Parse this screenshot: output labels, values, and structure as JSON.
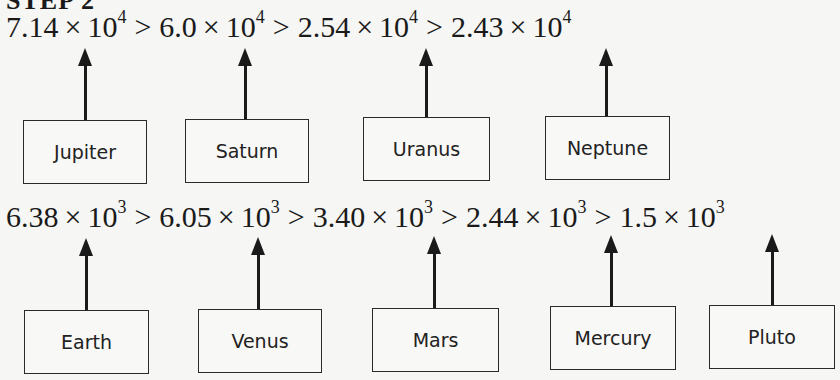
{
  "step_title": "STEP 2",
  "row1": {
    "formula": [
      {
        "mantissa": "7.14",
        "base": "10",
        "exponent": "4"
      },
      {
        "mantissa": "6.0",
        "base": "10",
        "exponent": "4"
      },
      {
        "mantissa": "2.54",
        "base": "10",
        "exponent": "4"
      },
      {
        "mantissa": "2.43",
        "base": "10",
        "exponent": "4"
      }
    ],
    "planets": [
      "Jupiter",
      "Saturn",
      "Uranus",
      "Neptune"
    ]
  },
  "row2": {
    "formula": [
      {
        "mantissa": "6.38",
        "base": "10",
        "exponent": "3"
      },
      {
        "mantissa": "6.05",
        "base": "10",
        "exponent": "3"
      },
      {
        "mantissa": "3.40",
        "base": "10",
        "exponent": "3"
      },
      {
        "mantissa": "2.44",
        "base": "10",
        "exponent": "3"
      },
      {
        "mantissa": "1.5",
        "base": "10",
        "exponent": "3"
      }
    ],
    "planets": [
      "Earth",
      "Venus",
      "Mars",
      "Mercury",
      "Pluto"
    ]
  },
  "symbols": {
    "times": "×",
    "greater_than": ">"
  }
}
